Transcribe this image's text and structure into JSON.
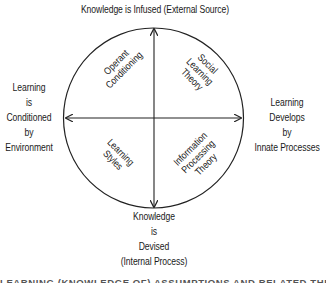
{
  "diagram": {
    "axes": {
      "top": [
        "Knowledge is Infused (External Source)"
      ],
      "bottom": [
        "Knowledge",
        "is",
        "Devised",
        "(Internal Process)"
      ],
      "left": [
        "Learning",
        "is",
        "Conditioned",
        "by",
        "Environment"
      ],
      "right": [
        "Learning",
        "Develops",
        "by",
        "Innate Processes"
      ]
    },
    "quadrants": {
      "top_left": [
        "Operant",
        "Conditioning"
      ],
      "top_right": [
        "Social",
        "Learning",
        "Theory"
      ],
      "bottom_left": [
        "Learning",
        "Styles"
      ],
      "bottom_right": [
        "Information",
        "Processing",
        "Theory"
      ]
    },
    "caption": "LEARNING (KNOWLEDGE OF) ASSUMPTIONS AND RELATED THEORIES"
  }
}
